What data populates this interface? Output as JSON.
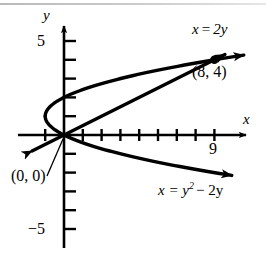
{
  "figure": {
    "type": "math-graph",
    "background_color": "#ffffff",
    "curve_color": "#000000",
    "axis_color": "#000000",
    "top_rule_color": "#bdbdbd"
  },
  "axes": {
    "x_label": "x",
    "y_label": "y",
    "x_tick_labels": [
      {
        "value": 9,
        "text": "9"
      }
    ],
    "y_tick_labels": [
      {
        "value": 5,
        "text": "5"
      },
      {
        "value": -5,
        "text": "−5"
      }
    ],
    "x_range": [
      -2,
      11
    ],
    "y_range": [
      -6.2,
      6.0
    ],
    "x_ticks": [
      1,
      2,
      3,
      4,
      5,
      6,
      7,
      8,
      9
    ],
    "y_ticks": [
      -5,
      -4,
      -3,
      -2,
      -1,
      1,
      2,
      3,
      4,
      5
    ],
    "grid": false
  },
  "chart_data": {
    "type": "line",
    "title": "",
    "xlabel": "x",
    "ylabel": "y",
    "xlim": [
      -2,
      11
    ],
    "ylim": [
      -6.2,
      6.0
    ],
    "series": [
      {
        "name": "x = y^2 - 2y",
        "label": "x = y² − 2y",
        "kind": "parabola",
        "equation": "x = y^2 - 2y",
        "vertex": {
          "x": -1,
          "y": 1
        },
        "points": [
          {
            "x": 8,
            "y": 4
          },
          {
            "x": 3,
            "y": 3
          },
          {
            "x": 0,
            "y": 2
          },
          {
            "x": -1,
            "y": 1
          },
          {
            "x": 0,
            "y": 0
          },
          {
            "x": 3,
            "y": -1
          },
          {
            "x": 8,
            "y": -2
          }
        ]
      },
      {
        "name": "x = 2y",
        "label": "x = 2y",
        "kind": "line",
        "equation": "x = 2y",
        "points": [
          {
            "x": -2,
            "y": -1
          },
          {
            "x": 0,
            "y": 0
          },
          {
            "x": 8,
            "y": 4
          }
        ]
      }
    ],
    "intersections": [
      {
        "x": 0,
        "y": 0,
        "label": "(0, 0)",
        "marker": "none"
      },
      {
        "x": 8,
        "y": 4,
        "label": "(8, 4)",
        "marker": "filled-dot"
      }
    ],
    "annotations": [
      {
        "id": "line-equation",
        "text": "x = 2y"
      },
      {
        "id": "parabola-equation",
        "text": "x = y² − 2y"
      },
      {
        "id": "origin-point",
        "text": "(0, 0)"
      },
      {
        "id": "intersection-point",
        "text": "(8, 4)"
      }
    ]
  },
  "labels": {
    "line_equation_lhs": "x",
    "line_equation_eq": "=",
    "line_equation_rhs": "2y",
    "parabola_equation_text": "x = y",
    "parabola_exponent": "2",
    "parabola_equation_tail": "− 2y",
    "origin_text": "(0, 0)",
    "intersection_text": "(8, 4)",
    "x_axis": "x",
    "y_axis": "y",
    "tick_9": "9",
    "tick_5": "5",
    "tick_neg5": "−5"
  }
}
